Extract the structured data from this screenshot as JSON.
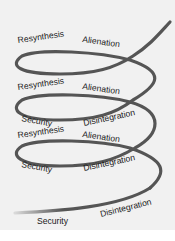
{
  "diagram": {
    "type": "spiral",
    "colors": {
      "background": "#f1f1f1",
      "curve": "#555555",
      "text": "#1a1a1a"
    },
    "levels": [
      {
        "level": 1,
        "labels": {
          "left_top": "Resynthesis",
          "right_top": "Alienation"
        }
      },
      {
        "level": 2,
        "labels": {
          "left_top": "Resynthesis",
          "right_top": "Alienation",
          "left_bottom": "Security",
          "right_bottom": "Disintegration"
        }
      },
      {
        "level": 3,
        "labels": {
          "left_top": "Resynthesis",
          "right_top": "Alienation",
          "left_bottom": "Security",
          "right_bottom": "Disintegration"
        }
      },
      {
        "level": 4,
        "labels": {
          "left_bottom": "Security",
          "right_bottom": "Disintegration"
        }
      }
    ]
  }
}
